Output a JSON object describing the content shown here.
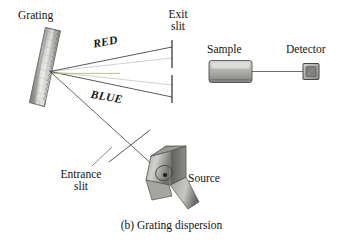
{
  "figure": {
    "caption": "(b) Grating dispersion",
    "labels": {
      "grating": "Grating",
      "exit_slit_line1": "Exit",
      "exit_slit_line2": "slit",
      "sample": "Sample",
      "detector": "Detector",
      "source": "Source",
      "entrance_slit_line1": "Entrance",
      "entrance_slit_line2": "slit",
      "ray_red": "RED",
      "ray_blue": "BLUE"
    },
    "colors": {
      "ink": "#141414",
      "ray_line": "#3c3c3c",
      "violet_beam": "#8a86c8",
      "green_beam": "#b5b464",
      "olive_beam": "#9a9a50",
      "metal_light": "#e2e2e0",
      "metal_mid": "#b7b7b3",
      "metal_dark": "#6e6e6c",
      "metal_shadow": "#4a4a49",
      "background": "#ffffff"
    },
    "components": [
      {
        "name": "grating",
        "kind": "diffraction-grating",
        "note": "tilted serrated strip"
      },
      {
        "name": "exit-slit",
        "kind": "slit",
        "note": "two vertical bars with gap"
      },
      {
        "name": "sample",
        "kind": "cuvette",
        "note": "gray rectangular cell"
      },
      {
        "name": "detector",
        "kind": "detector",
        "note": "small square sensor"
      },
      {
        "name": "source",
        "kind": "lamp",
        "note": "3D lamp housing"
      },
      {
        "name": "entrance-slit",
        "kind": "slit",
        "note": "short bar across beam"
      }
    ],
    "rays": [
      {
        "name": "red-ray",
        "label": "RED",
        "from": "grating",
        "to": "exit-slit-upper"
      },
      {
        "name": "central-ray",
        "label": "",
        "from": "grating",
        "to": "detector"
      },
      {
        "name": "blue-ray",
        "label": "BLUE",
        "from": "grating",
        "to": "exit-slit-lower"
      },
      {
        "name": "source-ray",
        "label": "",
        "from": "source",
        "to": "grating"
      }
    ]
  }
}
